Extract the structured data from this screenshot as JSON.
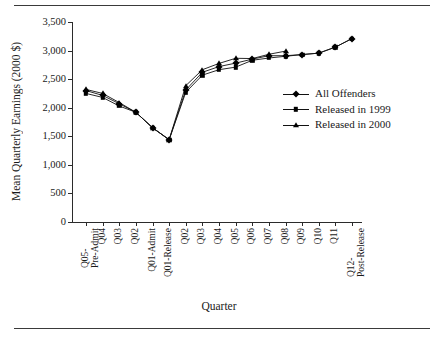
{
  "figure": {
    "title": "",
    "xlabel": "Quarter",
    "ylabel": "Mean Quarterly Earnings (2000 $)"
  },
  "legend": {
    "position": "inside-right",
    "entries": [
      {
        "label": "All Offenders",
        "marker": "diamond-marker-icon"
      },
      {
        "label": "Released in 1999",
        "marker": "square-marker-icon"
      },
      {
        "label": "Released in 2000",
        "marker": "triangle-marker-icon"
      }
    ]
  },
  "yticks": [
    "0",
    "500",
    "1,000",
    "1,500",
    "2,000",
    "2,500",
    "3,000",
    "3,500"
  ],
  "xticks": [
    {
      "l1": "Q05-",
      "l2": "Pre-Admit"
    },
    {
      "l1": "Q04",
      "l2": ""
    },
    {
      "l1": "Q03",
      "l2": ""
    },
    {
      "l1": "Q02",
      "l2": ""
    },
    {
      "l1": "Q01-Admit",
      "l2": ""
    },
    {
      "l1": "Q01-Release",
      "l2": ""
    },
    {
      "l1": "Q02",
      "l2": ""
    },
    {
      "l1": "Q03",
      "l2": ""
    },
    {
      "l1": "Q04",
      "l2": ""
    },
    {
      "l1": "Q05",
      "l2": ""
    },
    {
      "l1": "Q06",
      "l2": ""
    },
    {
      "l1": "Q07",
      "l2": ""
    },
    {
      "l1": "Q08",
      "l2": ""
    },
    {
      "l1": "Q09",
      "l2": ""
    },
    {
      "l1": "Q10",
      "l2": ""
    },
    {
      "l1": "Q11",
      "l2": ""
    },
    {
      "l1": "Q12-",
      "l2": "Post-Release"
    }
  ],
  "chart_data": {
    "type": "line",
    "title": "",
    "xlabel": "Quarter",
    "ylabel": "Mean Quarterly Earnings (2000 $)",
    "ylim": [
      0,
      3500
    ],
    "ytick_step": 500,
    "grid": false,
    "legend_position": "inside-right",
    "categories": [
      "Q05-Pre-Admit",
      "Q04",
      "Q03",
      "Q02",
      "Q01-Admit",
      "Q01-Release",
      "Q02",
      "Q03",
      "Q04",
      "Q05",
      "Q06",
      "Q07",
      "Q08",
      "Q09",
      "Q10",
      "Q11",
      "Q12-Post-Release"
    ],
    "series": [
      {
        "name": "All Offenders",
        "marker": "diamond",
        "values": [
          2300,
          2215,
          2070,
          1920,
          1650,
          1440,
          2310,
          2620,
          2720,
          2780,
          2850,
          2910,
          2910,
          2930,
          2955,
          3060,
          3210
        ]
      },
      {
        "name": "Released in 1999",
        "marker": "square",
        "values": [
          2250,
          2180,
          2030,
          1920,
          1650,
          1440,
          2270,
          2570,
          2665,
          2710,
          2830,
          2870,
          2900,
          2930,
          2955,
          3060,
          3210
        ]
      },
      {
        "name": "Released in 2000",
        "marker": "triangle",
        "values": [
          2320,
          2250,
          2090,
          1920,
          1650,
          1440,
          2385,
          2665,
          2775,
          2865,
          2860,
          2935,
          2990,
          null,
          null,
          null,
          null
        ]
      }
    ]
  }
}
